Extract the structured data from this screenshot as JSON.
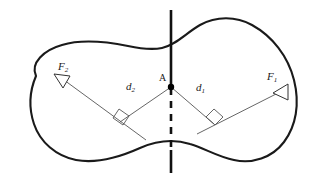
{
  "figure": {
    "type": "free-body-diagram",
    "background_color": "#ffffff",
    "outline_color": "#1a1a1a",
    "line_color": "#555555",
    "axis_color": "#111111",
    "labels": {
      "force_left": {
        "symbol": "F",
        "subscript": "2",
        "text": "F2"
      },
      "force_right": {
        "symbol": "F",
        "subscript": "1",
        "text": "F1"
      },
      "distance_left": {
        "symbol": "d",
        "subscript": "2",
        "text": "d2"
      },
      "distance_right": {
        "symbol": "d",
        "subscript": "1",
        "text": "d1"
      },
      "pivot_point": {
        "text": "A"
      }
    },
    "elements": {
      "body_outline": "closed irregular blob outline",
      "axis_line": "vertical line through point A, solid above, dashed below",
      "pivot_dot": "filled black dot at point A",
      "force_vector_left": "arrow pointing up-left labeled F2",
      "force_vector_right": "arrow pointing up-right labeled F1",
      "moment_arm_left": "segment from A perpendicular to F2 line of action",
      "moment_arm_right": "segment from A perpendicular to F1 line of action",
      "right_angle_left": "square right-angle marker on F2 line",
      "right_angle_right": "square right-angle marker on F1 line"
    }
  }
}
